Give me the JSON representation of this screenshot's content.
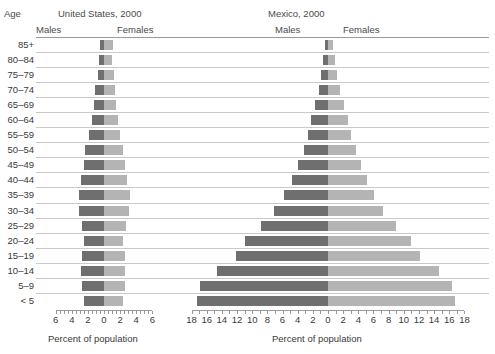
{
  "header": {
    "age_column_label": "Age",
    "panels": [
      {
        "title": "United States, 2000",
        "males_label": "Males",
        "females_label": "Females"
      },
      {
        "title": "Mexico, 2000",
        "males_label": "Males",
        "females_label": "Females"
      }
    ]
  },
  "axis_title": "Percent of population",
  "colors": {
    "male": "#6f6f6f",
    "female": "#b4b4b4",
    "gridline": "#c9c9c9",
    "axis": "#9a9a9a",
    "text": "#3a3a3a"
  },
  "chart_data": {
    "type": "bar",
    "subtype": "population-pyramid",
    "title": "",
    "xlabel": "Percent of population",
    "ylabel": "Age",
    "grid": true,
    "legend": "inline-headers",
    "categories": [
      "85+",
      "80–84",
      "75–79",
      "70–74",
      "65–69",
      "60–64",
      "55–59",
      "50–54",
      "45–49",
      "40–44",
      "35–39",
      "30–34",
      "25–29",
      "20–24",
      "15–19",
      "10–14",
      "5–9",
      "< 5"
    ],
    "panels": [
      {
        "name": "United States, 2000",
        "xlim": [
          -6,
          6
        ],
        "xticks": [
          -6,
          -4,
          -2,
          0,
          2,
          4,
          6
        ],
        "xticklabels": [
          "6",
          "4",
          "2",
          "0",
          "2",
          "4",
          "6"
        ],
        "minor_tick_step": 0.5,
        "series": [
          {
            "name": "Males",
            "values": [
              0.5,
              0.6,
              0.8,
              1.1,
              1.3,
              1.5,
              1.9,
              2.3,
              2.5,
              2.9,
              3.1,
              3.1,
              2.7,
              2.5,
              2.7,
              2.8,
              2.7,
              2.5
            ]
          },
          {
            "name": "Females",
            "values": [
              1.1,
              1.0,
              1.2,
              1.4,
              1.5,
              1.7,
              2.0,
              2.4,
              2.6,
              2.9,
              3.2,
              3.1,
              2.7,
              2.4,
              2.6,
              2.6,
              2.6,
              2.4
            ]
          }
        ]
      },
      {
        "name": "Mexico, 2000",
        "xlim": [
          -18,
          18
        ],
        "xticks": [
          -18,
          -16,
          -14,
          -12,
          -10,
          -8,
          -6,
          -4,
          -2,
          0,
          2,
          4,
          6,
          8,
          10,
          12,
          14,
          16,
          18
        ],
        "xticklabels": [
          "18",
          "16",
          "14",
          "12",
          "10",
          "8",
          "6",
          "4",
          "2",
          "0",
          "2",
          "4",
          "6",
          "8",
          "10",
          "12",
          "14",
          "16",
          "18"
        ],
        "minor_tick_step": 1,
        "series": [
          {
            "name": "Males",
            "values": [
              0.4,
              0.6,
              0.9,
              1.2,
              1.7,
              2.2,
              2.6,
              3.2,
              3.9,
              4.8,
              5.8,
              7.1,
              8.9,
              10.9,
              12.2,
              14.7,
              16.9,
              17.3
            ]
          },
          {
            "name": "Females",
            "values": [
              0.6,
              0.9,
              1.2,
              1.6,
              2.1,
              2.6,
              3.1,
              3.7,
              4.4,
              5.2,
              6.1,
              7.3,
              9.0,
              10.9,
              12.2,
              14.6,
              16.4,
              16.8
            ]
          }
        ]
      }
    ]
  }
}
